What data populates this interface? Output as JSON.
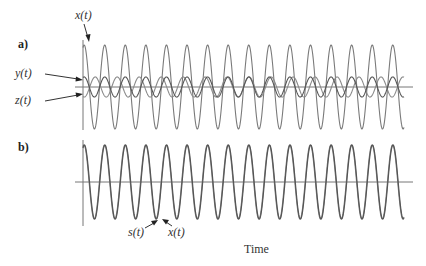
{
  "figure": {
    "panel_a_label": "a)",
    "panel_b_label": "b)",
    "xlabel": "Time",
    "labels": {
      "x_top": "x(t)",
      "y_top": "y(t)",
      "z_top": "z(t)",
      "s_bottom": "s(t)",
      "x_bottom": "x(t)"
    },
    "colors": {
      "axis": "#777777",
      "wave_x": "#7a7a7a",
      "wave_y": "#555555",
      "wave_z": "#8a8a8a",
      "wave_s": "#555555",
      "text": "#333333"
    }
  },
  "chart_data": [
    {
      "type": "line",
      "panel": "a",
      "title": "a)",
      "xlabel": "Time",
      "ylabel": "",
      "grid": false,
      "x_range_px": [
        83,
        404
      ],
      "series": [
        {
          "name": "x(t)",
          "shape": "sinusoid",
          "amplitude": 1.0,
          "cycles": 15.6,
          "phase": "cosine (starts at peak)"
        },
        {
          "name": "y(t)",
          "shape": "sinusoid",
          "amplitude": 0.24,
          "cycles": 15.6,
          "phase": "starts near +peak, beats relative to z(t)"
        },
        {
          "name": "z(t)",
          "shape": "sinusoid",
          "amplitude": 0.24,
          "cycles": 14.6,
          "phase": "starts near -peak, beats relative to y(t)"
        }
      ],
      "annotations": [
        "x(t)",
        "y(t)",
        "z(t)"
      ]
    },
    {
      "type": "line",
      "panel": "b",
      "title": "b)",
      "xlabel": "Time",
      "ylabel": "",
      "grid": false,
      "x_range_px": [
        83,
        404
      ],
      "series": [
        {
          "name": "s(t)",
          "shape": "sinusoid",
          "amplitude": 1.0,
          "cycles": 15.6,
          "phase": "cosine"
        },
        {
          "name": "x(t)",
          "shape": "sinusoid",
          "amplitude": 1.0,
          "cycles": 15.6,
          "phase": "slightly shifted from s(t)"
        }
      ],
      "annotations": [
        "s(t)",
        "x(t)"
      ]
    }
  ]
}
